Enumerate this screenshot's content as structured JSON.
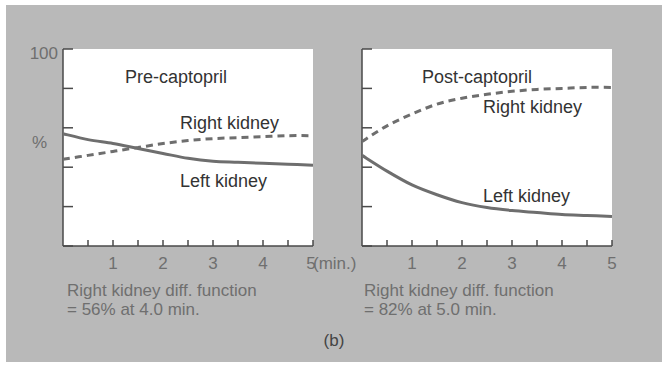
{
  "figure": {
    "label": "(b)",
    "colors": {
      "background": "#b9b9b9",
      "plot_bg": "#ffffff",
      "axis": "#4a4a4a",
      "line": "#6e6e6e",
      "text_dark": "#333333",
      "text_light": "#6f6f6f"
    },
    "y_axis": {
      "top_label": "100",
      "unit_label": "%"
    },
    "x_axis": {
      "unit_label": "(min.)",
      "tick_labels": [
        "1",
        "2",
        "3",
        "4",
        "5"
      ]
    },
    "panels": [
      {
        "title": "Pre-captopril",
        "right_label": "Right kidney",
        "left_label": "Left kidney",
        "caption_line1": "Right kidney diff. function",
        "caption_line2": "= 56% at 4.0 min."
      },
      {
        "title": "Post-captopril",
        "right_label": "Right kidney",
        "left_label": "Left kidney",
        "caption_line1": "Right kidney diff. function",
        "caption_line2": "= 82% at 5.0 min."
      }
    ]
  },
  "chart_data": [
    {
      "type": "line",
      "title": "Pre-captopril",
      "xlabel": "(min.)",
      "ylabel": "%",
      "xlim": [
        0,
        5
      ],
      "ylim": [
        0,
        100
      ],
      "x": [
        0,
        0.5,
        1,
        1.5,
        2,
        2.5,
        3,
        3.5,
        4,
        4.5,
        5
      ],
      "series": [
        {
          "name": "Right kidney",
          "style": "dashed",
          "values": [
            44,
            46,
            48,
            50,
            52,
            53.5,
            54.5,
            55,
            55.5,
            56,
            56
          ]
        },
        {
          "name": "Left kidney",
          "style": "solid",
          "values": [
            57,
            54,
            52,
            49.5,
            47,
            44.5,
            43,
            42.5,
            42,
            41.5,
            41
          ]
        }
      ],
      "annotations": [
        "Right kidney diff. function = 56% at 4.0 min."
      ],
      "grid": false
    },
    {
      "type": "line",
      "title": "Post-captopril",
      "xlabel": "(min.)",
      "ylabel": "%",
      "xlim": [
        0,
        5
      ],
      "ylim": [
        0,
        100
      ],
      "x": [
        0,
        0.5,
        1,
        1.5,
        2,
        2.5,
        3,
        3.5,
        4,
        4.5,
        5
      ],
      "series": [
        {
          "name": "Right kidney",
          "style": "dashed",
          "values": [
            53,
            61,
            67,
            72,
            75,
            77,
            78.5,
            79.5,
            80,
            80.5,
            80.5
          ]
        },
        {
          "name": "Left kidney",
          "style": "solid",
          "values": [
            46,
            38,
            31,
            26,
            22,
            19.5,
            18,
            17,
            16,
            15.5,
            15
          ]
        }
      ],
      "annotations": [
        "Right kidney diff. function = 82% at 5.0 min."
      ],
      "grid": false
    }
  ]
}
